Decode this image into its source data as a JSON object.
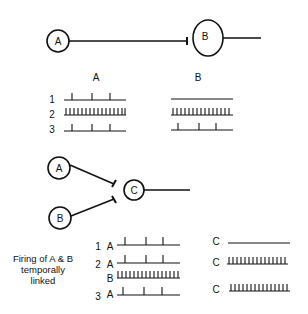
{
  "top_circuit": {
    "neuron_a": "A",
    "neuron_b": "B",
    "connection": "inhibitory A to B"
  },
  "top_traces": {
    "column_a_label": "A",
    "column_b_label": "B",
    "rows": [
      {
        "num": "1",
        "a_spikes": [
          0.2,
          0.55,
          0.8
        ],
        "b_spikes": []
      },
      {
        "num": "2",
        "a_spikes": "tonic",
        "b_spikes": "tonic"
      },
      {
        "num": "3",
        "a_spikes": [
          0.2,
          0.55,
          0.8
        ],
        "b_spikes": [
          0.12,
          0.45,
          0.72
        ]
      }
    ]
  },
  "bottom_circuit": {
    "neuron_a": "A",
    "neuron_b": "B",
    "neuron_c": "C",
    "connection": "A and B inhibit C"
  },
  "bottom_traces": {
    "note_lines": [
      "Firing of A & B",
      "temporally",
      "linked"
    ],
    "rows": [
      {
        "num": "1",
        "label": "A",
        "spikes": [
          0.15,
          0.5,
          0.75
        ],
        "c_label": "C",
        "c_spikes": "silent"
      },
      {
        "num": "2",
        "label": "A",
        "spikes": [
          0.15,
          0.5,
          0.75
        ],
        "c_label": "C",
        "c_spikes": "tonic"
      },
      {
        "num": "",
        "label": "B",
        "spikes": "tonic"
      },
      {
        "num": "3",
        "label": "A",
        "spikes": [
          0.1,
          0.45,
          0.7
        ],
        "c_label": "C",
        "c_spikes": "tonic"
      }
    ]
  }
}
